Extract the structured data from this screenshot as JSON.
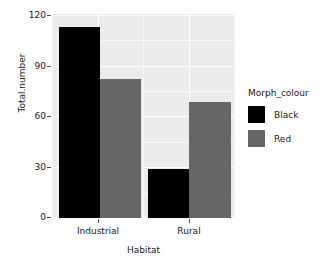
{
  "chart_data": {
    "type": "bar",
    "title": "",
    "subtitle": "",
    "xlabel": "Habitat",
    "ylabel": "Total.number",
    "categories": [
      "Industrial",
      "Rural"
    ],
    "series": [
      {
        "name": "Black",
        "color": "#000000",
        "values": [
          114,
          29
        ]
      },
      {
        "name": "Red",
        "color": "#666666",
        "values": [
          83,
          69
        ]
      }
    ],
    "legend": {
      "title": "Morph_colour",
      "position": "right",
      "entries": [
        {
          "label": "Black",
          "color": "#000000"
        },
        {
          "label": "Red",
          "color": "#666666"
        }
      ]
    },
    "yticks": [
      0,
      30,
      60,
      90,
      120
    ],
    "ytick_labels": [
      "0",
      "30",
      "60",
      "90",
      "120"
    ],
    "ylim": [
      0,
      121.5
    ],
    "xtick_labels": [
      "Industrial",
      "Rural"
    ],
    "grid": true,
    "panel_background": "#ebebeb",
    "grid_color": "#ffffff",
    "plot_background": "#ffffff",
    "position": "dodge"
  }
}
